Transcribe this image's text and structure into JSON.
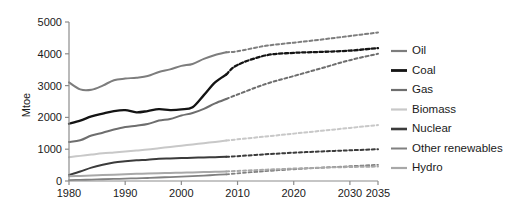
{
  "chart_data": {
    "type": "line",
    "title": "",
    "xlabel": "",
    "ylabel": "Mtoe",
    "xlim": [
      1980,
      2035
    ],
    "ylim": [
      0,
      5000
    ],
    "grid": false,
    "legend_position": "right",
    "xticks": [
      "1980",
      "1990",
      "2000",
      "2010",
      "2020",
      "2030",
      "2035"
    ],
    "xtick_values": [
      1980,
      1990,
      2000,
      2010,
      2020,
      2030,
      2035
    ],
    "yticks": [
      "0",
      "1000",
      "2000",
      "3000",
      "4000",
      "5000"
    ],
    "ytick_values": [
      0,
      1000,
      2000,
      3000,
      4000,
      5000
    ],
    "history_end_year": 2008,
    "note": "Solid segments are historical data (1980-2008); dashed segments are projections (2008-2035).",
    "x": [
      1980,
      1982,
      1984,
      1986,
      1988,
      1990,
      1992,
      1994,
      1996,
      1998,
      2000,
      2002,
      2004,
      2006,
      2008,
      2010,
      2015,
      2020,
      2025,
      2030,
      2035
    ],
    "series": [
      {
        "name": "Oil",
        "color": "#7d7d7d",
        "width": 2.0,
        "values": [
          3100,
          2880,
          2870,
          3000,
          3170,
          3220,
          3250,
          3300,
          3430,
          3510,
          3620,
          3680,
          3840,
          3960,
          4050,
          4080,
          4250,
          4350,
          4450,
          4560,
          4670
        ]
      },
      {
        "name": "Coal",
        "color": "#141414",
        "width": 2.3,
        "values": [
          1800,
          1900,
          2030,
          2120,
          2200,
          2230,
          2160,
          2200,
          2260,
          2230,
          2250,
          2320,
          2700,
          3100,
          3350,
          3650,
          3950,
          4030,
          4060,
          4100,
          4180
        ]
      },
      {
        "name": "Gas",
        "color": "#6e6e6e",
        "width": 2.0,
        "values": [
          1230,
          1280,
          1430,
          1520,
          1620,
          1700,
          1740,
          1790,
          1900,
          1950,
          2060,
          2140,
          2270,
          2440,
          2580,
          2720,
          3050,
          3300,
          3550,
          3800,
          4000
        ]
      },
      {
        "name": "Biomass",
        "color": "#c8c8c8",
        "width": 2.0,
        "values": [
          750,
          790,
          830,
          870,
          900,
          930,
          960,
          990,
          1030,
          1070,
          1110,
          1150,
          1190,
          1230,
          1270,
          1310,
          1400,
          1490,
          1580,
          1670,
          1760
        ]
      },
      {
        "name": "Nuclear",
        "color": "#3b3b3b",
        "width": 2.0,
        "values": [
          190,
          300,
          420,
          510,
          580,
          620,
          650,
          670,
          700,
          710,
          720,
          730,
          740,
          750,
          760,
          780,
          840,
          890,
          930,
          965,
          1000
        ]
      },
      {
        "name": "Other renewables",
        "color": "#808080",
        "width": 1.8,
        "values": [
          30,
          35,
          45,
          55,
          65,
          75,
          85,
          95,
          110,
          125,
          140,
          155,
          170,
          190,
          210,
          240,
          310,
          370,
          420,
          465,
          510
        ]
      },
      {
        "name": "Hydro",
        "color": "#a8a8a8",
        "width": 2.0,
        "values": [
          150,
          160,
          175,
          190,
          200,
          215,
          225,
          235,
          245,
          255,
          260,
          270,
          280,
          290,
          300,
          315,
          355,
          390,
          420,
          440,
          455
        ]
      }
    ]
  },
  "legend": {
    "items": [
      {
        "label": "Oil",
        "color": "#7d7d7d",
        "width": 2.2
      },
      {
        "label": "Coal",
        "color": "#141414",
        "width": 2.8
      },
      {
        "label": "Gas",
        "color": "#6e6e6e",
        "width": 2.2
      },
      {
        "label": "Biomass",
        "color": "#c8c8c8",
        "width": 2.2
      },
      {
        "label": "Nuclear",
        "color": "#3b3b3b",
        "width": 2.6
      },
      {
        "label": "Other renewables",
        "color": "#808080",
        "width": 2.0
      },
      {
        "label": "Hydro",
        "color": "#a8a8a8",
        "width": 2.2
      }
    ]
  }
}
